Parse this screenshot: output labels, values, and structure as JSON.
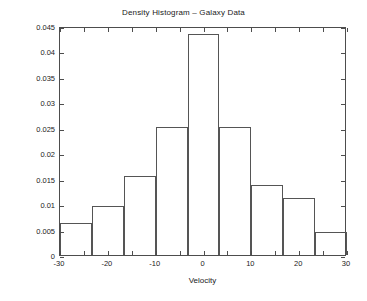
{
  "chart_data": {
    "type": "bar",
    "title": "Density Histogram – Galaxy Data",
    "xlabel": "Velocity",
    "ylabel": "",
    "xlim": [
      -30,
      30
    ],
    "ylim": [
      0,
      0.045
    ],
    "grid": false,
    "legend": null,
    "bin_edges": [
      -30,
      -23.333,
      -16.667,
      -10,
      -3.333,
      3.333,
      10,
      16.667,
      23.333,
      30
    ],
    "categories": [
      "-30 to -23.3",
      "-23.3 to -16.7",
      "-16.7 to -10",
      "-10 to -3.3",
      "-3.3 to 3.3",
      "3.3 to 10",
      "10 to 16.7",
      "16.7 to 23.3",
      "23.3 to 30"
    ],
    "values": [
      0.0063,
      0.0097,
      0.0155,
      0.0251,
      0.0435,
      0.0252,
      0.0137,
      0.0113,
      0.0045
    ],
    "x_ticks": [
      -30,
      -20,
      -10,
      0,
      10,
      20,
      30
    ],
    "x_tick_labels": [
      "-30",
      "-20",
      "-10",
      "0",
      "10",
      "20",
      "30"
    ],
    "x_minor_ticks": [
      -25,
      -15,
      -5,
      5,
      15,
      25
    ],
    "y_ticks": [
      0,
      0.005,
      0.01,
      0.015,
      0.02,
      0.025,
      0.03,
      0.035,
      0.04,
      0.045
    ],
    "y_tick_labels": [
      "0",
      "0.005",
      "0.01",
      "0.015",
      "0.02",
      "0.025",
      "0.03",
      "0.035",
      "0.04",
      "0.045"
    ],
    "colors": {
      "bar_edge": "#555555",
      "bar_fill": "transparent",
      "axis": "#4d4d4d",
      "text": "#1a1a1a",
      "background": "#ffffff"
    }
  }
}
